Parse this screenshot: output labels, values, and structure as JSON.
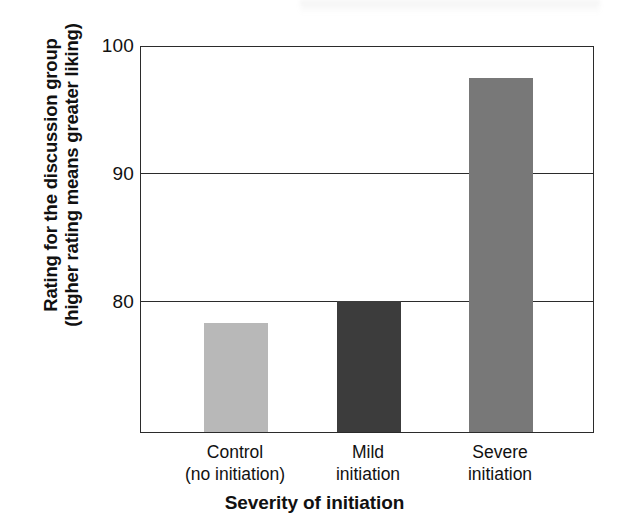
{
  "chart_data": {
    "type": "bar",
    "title": "",
    "xlabel": "Severity of initiation",
    "ylabel_line1": "Rating for the discussion group",
    "ylabel_line2": "(higher rating means greater liking)",
    "categories": [
      "Control\n(no initiation)",
      "Mild\ninitiation",
      "Severe\ninitiation"
    ],
    "category_lines": [
      [
        "Control",
        "(no initiation)"
      ],
      [
        "Mild",
        "initiation"
      ],
      [
        "Severe",
        "initiation"
      ]
    ],
    "values": [
      80.3,
      81.9,
      97.9
    ],
    "bar_colors": [
      "#b8b8b8",
      "#3c3c3c",
      "#787878"
    ],
    "ylim": [
      72.5,
      100.3
    ],
    "yticks": [
      100,
      90,
      80
    ],
    "ytick_labels": [
      "100",
      "90",
      "80"
    ],
    "gridlines": [
      90,
      80
    ],
    "grid": true,
    "legend": "none",
    "axis_color": "#2b2b2b"
  },
  "axis": {
    "y_tick_0": "100",
    "y_tick_1": "90",
    "y_tick_2": "80"
  },
  "labels": {
    "x_axis_title": "Severity of initiation",
    "y_axis_title_line1": "Rating for the discussion group",
    "y_axis_title_line2": "(higher rating means greater liking)",
    "cat0_line1": "Control",
    "cat0_line2": "(no initiation)",
    "cat1_line1": "Mild",
    "cat1_line2": "initiation",
    "cat2_line1": "Severe",
    "cat2_line2": "initiation"
  }
}
